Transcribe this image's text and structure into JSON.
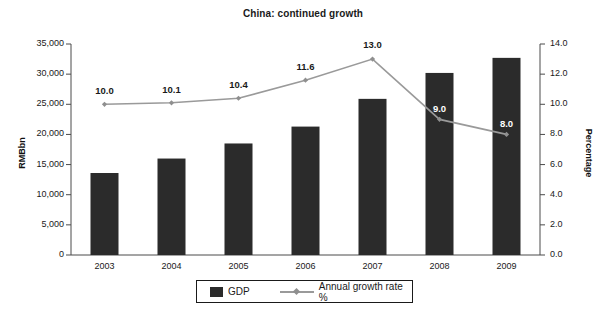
{
  "chart_data": {
    "type": "bar",
    "title": "China: continued growth",
    "categories": [
      "2003",
      "2004",
      "2005",
      "2006",
      "2007",
      "2008",
      "2009"
    ],
    "xlabel": "",
    "ylabel": "RMBbn",
    "y2label": "Percentage",
    "ylim": [
      0,
      35000
    ],
    "y2lim": [
      0,
      14
    ],
    "grid": false,
    "legend_position": "bottom",
    "y_ticks": [
      "0",
      "5,000",
      "10,000",
      "15,000",
      "20,000",
      "25,000",
      "30,000",
      "35,000"
    ],
    "y_tick_values": [
      0,
      5000,
      10000,
      15000,
      20000,
      25000,
      30000,
      35000
    ],
    "y2_ticks": [
      "0.0",
      "2.0",
      "4.0",
      "6.0",
      "8.0",
      "10.0",
      "12.0",
      "14.0"
    ],
    "y2_tick_values": [
      0,
      2,
      4,
      6,
      8,
      10,
      12,
      14
    ],
    "series": [
      {
        "name": "GDP",
        "type": "bar",
        "axis": "left",
        "unit": "RMBbn",
        "color": "#2b2b2b",
        "values": [
          13600,
          16000,
          18500,
          21300,
          25900,
          30200,
          32700
        ]
      },
      {
        "name": "Annual growth rate %",
        "type": "line",
        "axis": "right",
        "unit": "%",
        "color": "#9a9a9a",
        "values": [
          10.0,
          10.1,
          10.4,
          11.6,
          13.0,
          9.0,
          8.0
        ],
        "point_labels": [
          "10.0",
          "10.1",
          "10.4",
          "11.6",
          "13.0",
          "9.0",
          "8.0"
        ]
      }
    ]
  },
  "legend": {
    "items": [
      {
        "label": "GDP"
      },
      {
        "label": "Annual growth rate %"
      }
    ]
  }
}
